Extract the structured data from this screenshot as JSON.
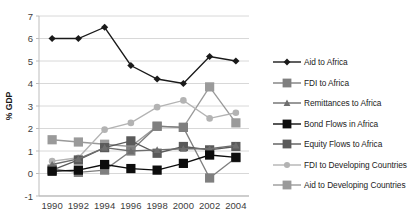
{
  "chart_data": {
    "type": "line",
    "title": "",
    "xlabel": "",
    "ylabel": "% GDP",
    "categories": [
      "1990",
      "1992",
      "1994",
      "1996",
      "1998",
      "2000",
      "2002",
      "2004"
    ],
    "x": [
      1990,
      1992,
      1994,
      1996,
      1998,
      2000,
      2002,
      2004
    ],
    "ylim": [
      -1,
      7
    ],
    "yticks": [
      "-1",
      "0",
      "1",
      "2",
      "3",
      "4",
      "5",
      "6",
      "7"
    ],
    "ytick_values": [
      -1,
      0,
      1,
      2,
      3,
      4,
      5,
      6,
      7
    ],
    "grid": "horizontal",
    "legend_position": "right",
    "series": [
      {
        "name": "Aid to Africa",
        "marker": "diamond",
        "color": "#1a1a1a",
        "values": [
          6.0,
          6.0,
          6.5,
          4.8,
          4.2,
          4.0,
          5.2,
          5.0
        ]
      },
      {
        "name": "FDI to Africa",
        "marker": "square",
        "color": "#7f7f7f",
        "values": [
          0.2,
          0.05,
          0.15,
          1.0,
          2.1,
          2.05,
          -0.2,
          0.7
        ]
      },
      {
        "name": "Remittances to Africa",
        "marker": "triangle",
        "color": "#6e6e6e",
        "values": [
          0.4,
          0.65,
          1.15,
          1.0,
          1.05,
          1.1,
          1.1,
          1.25
        ]
      },
      {
        "name": "Bond Flows in Africa",
        "marker": "square",
        "color": "#0d0d0d",
        "values": [
          0.1,
          0.15,
          0.4,
          0.22,
          0.15,
          0.45,
          0.82,
          0.72
        ]
      },
      {
        "name": "Equity Flows to Africa",
        "marker": "square",
        "color": "#5a5a5a",
        "values": [
          0.15,
          0.6,
          1.15,
          1.45,
          0.9,
          1.2,
          1.05,
          1.2
        ]
      },
      {
        "name": "FDI to Developing Countries",
        "marker": "circle",
        "color": "#b3b3b3",
        "values": [
          0.55,
          0.7,
          1.95,
          2.25,
          2.95,
          3.25,
          2.45,
          2.7
        ]
      },
      {
        "name": "Aid to Developing Countries",
        "marker": "square",
        "color": "#9a9a9a",
        "values": [
          1.5,
          1.4,
          1.3,
          1.2,
          2.1,
          2.05,
          3.85,
          2.25
        ]
      }
    ]
  }
}
